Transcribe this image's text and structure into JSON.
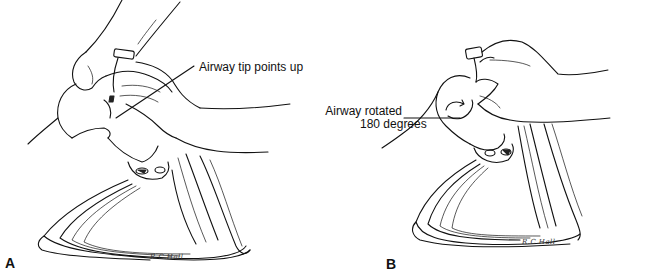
{
  "figure": {
    "panels": [
      {
        "id": "A",
        "letter": "A",
        "callout": "Airway tip points up",
        "signature": "R.C.Hall"
      },
      {
        "id": "B",
        "letter": "B",
        "callout_line1": "Airway rotated",
        "callout_line2": "180 degrees",
        "signature": "R.C.Hall"
      }
    ],
    "colors": {
      "ink": "#111111",
      "background": "#ffffff"
    }
  }
}
